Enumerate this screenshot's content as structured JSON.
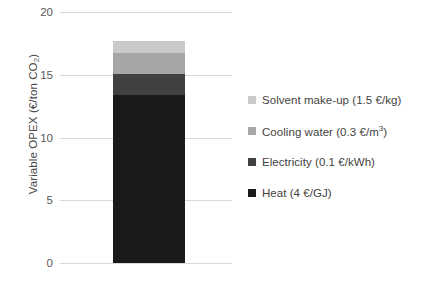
{
  "chart_data": {
    "type": "bar",
    "stacked": true,
    "title": "",
    "subtitle": "",
    "xlabel": "",
    "ylabel": "Variable OPEX (€/ton CO₂)",
    "ylabel_main": "Variable OPEX (€/ton CO",
    "ylabel_sub": "2",
    "ylabel_tail": ")",
    "categories": [
      ""
    ],
    "ylim": [
      0,
      20
    ],
    "yticks": [
      20,
      15,
      10,
      5,
      0
    ],
    "ytick_labels": [
      "20",
      "15",
      "10",
      "5",
      "0"
    ],
    "grid": true,
    "legend_position": "right",
    "total": 17.7,
    "series": [
      {
        "name": "Solvent make-up (1.5 €/kg)",
        "values": [
          1.0
        ],
        "color": "#c9c9c9"
      },
      {
        "name": "Cooling water (0.3 €/m³)",
        "values": [
          1.6
        ],
        "color": "#a6a6a6"
      },
      {
        "name": "Electricity (0.1 €/kWh)",
        "values": [
          1.7
        ],
        "color": "#404040"
      },
      {
        "name": "Heat (4 €/GJ)",
        "values": [
          13.4
        ],
        "color": "#1a1a1a"
      }
    ]
  },
  "legend": {
    "items": [
      {
        "label_main": "Solvent make-up (1.5 €/kg)",
        "label_sup": "",
        "color": "#c9c9c9"
      },
      {
        "label_main": "Cooling water (0.3 €/m",
        "label_sup": "3",
        "label_tail": ")",
        "color": "#a6a6a6"
      },
      {
        "label_main": "Electricity (0.1 €/kWh)",
        "label_sup": "",
        "color": "#404040"
      },
      {
        "label_main": "Heat (4 €/GJ)",
        "label_sup": "",
        "color": "#1a1a1a"
      }
    ]
  },
  "axis": {
    "gridline_color": "#d9d9d9",
    "tick_text_color": "#585858"
  }
}
